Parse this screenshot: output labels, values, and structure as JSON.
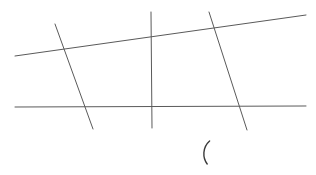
{
  "canvas": {
    "width": 316,
    "height": 175,
    "background_color": "#ffffff",
    "title": "Line figure"
  },
  "style": {
    "line_color": "#5a5a5a",
    "line_width": 1,
    "mark_color": "#3a3a3a",
    "mark_width": 1.4
  },
  "figure": {
    "strokes": [
      {
        "name": "upper-diagonal-line",
        "kind": "line",
        "orientation": "near-horizontal-rising",
        "x1": 15,
        "y1": 56,
        "x2": 306,
        "y2": 15
      },
      {
        "name": "lower-horizontal-line",
        "kind": "line",
        "orientation": "horizontal",
        "x1": 15,
        "y1": 107,
        "x2": 306,
        "y2": 106
      },
      {
        "name": "left-slanted-line",
        "kind": "line",
        "orientation": "steep-right-leaning",
        "x1": 55,
        "y1": 24,
        "x2": 93,
        "y2": 129
      },
      {
        "name": "center-vertical-line",
        "kind": "line",
        "orientation": "vertical",
        "x1": 151,
        "y1": 12,
        "x2": 152,
        "y2": 128
      },
      {
        "name": "right-slanted-line",
        "kind": "line",
        "orientation": "steep-right-leaning",
        "x1": 209,
        "y1": 12,
        "x2": 247,
        "y2": 130
      }
    ],
    "marks": [
      {
        "name": "left-parenthesis-mark",
        "kind": "paren",
        "glyph": "(",
        "x": 207,
        "y": 152,
        "top_y": 141,
        "bottom_y": 164
      }
    ],
    "intersections": [
      {
        "name": "diagonal-x-left-slant",
        "x": 67,
        "y": 50
      },
      {
        "name": "diagonal-x-center-vertical",
        "x": 151,
        "y": 38
      },
      {
        "name": "diagonal-x-right-slant",
        "x": 212,
        "y": 31
      },
      {
        "name": "horizontal-x-left-slant",
        "x": 85,
        "y": 107
      },
      {
        "name": "horizontal-x-center-vertical",
        "x": 151,
        "y": 107
      },
      {
        "name": "horizontal-x-right-slant",
        "x": 238,
        "y": 106
      }
    ]
  }
}
